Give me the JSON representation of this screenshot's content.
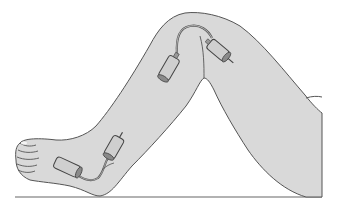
{
  "figure": {
    "colors": {
      "background": "#ffffff",
      "skin_fill": "#d9d9d9",
      "outline": "#555555",
      "sensor_fill": "#c8c8c8",
      "sensor_dark": "#777777",
      "ground_line": "#666666"
    },
    "parts": [
      {
        "name": "thigh"
      },
      {
        "name": "lower-leg"
      },
      {
        "name": "foot"
      },
      {
        "name": "knee-sensor-pair",
        "count": 2
      },
      {
        "name": "ankle-sensor-pair",
        "count": 2
      },
      {
        "name": "ground-line"
      }
    ]
  }
}
